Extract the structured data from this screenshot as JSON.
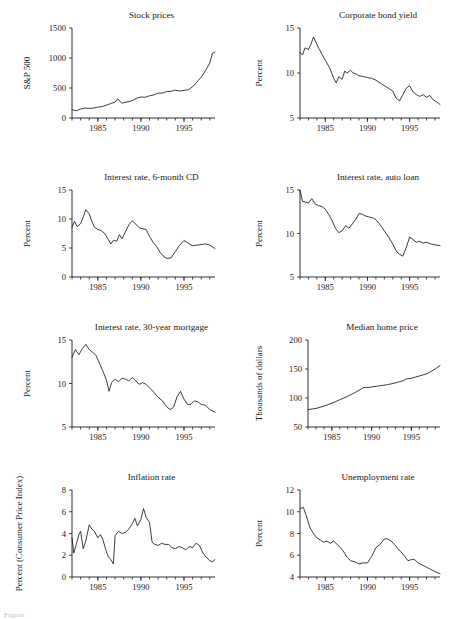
{
  "figure": {
    "background": "#ffffff",
    "ink_color": "#1a1a1a",
    "caption_fragment": "Figure"
  },
  "chart_data": [
    {
      "type": "line",
      "panel_index": 0,
      "title": "Stock prices",
      "xlabel": "",
      "ylabel": "S&P 500",
      "xlim": [
        1982.0,
        1998.6
      ],
      "ylim": [
        0,
        1500
      ],
      "yticks": [
        0,
        500,
        1000,
        1500
      ],
      "xticks": [
        1985,
        1990,
        1995
      ],
      "grid": false,
      "legend": "none",
      "x": [
        1982.0,
        1982.5,
        1983.0,
        1983.5,
        1984.0,
        1984.5,
        1985.0,
        1985.5,
        1986.0,
        1986.5,
        1987.0,
        1987.3,
        1987.8,
        1988.0,
        1988.5,
        1989.0,
        1989.5,
        1990.0,
        1990.5,
        1991.0,
        1991.5,
        1992.0,
        1992.5,
        1993.0,
        1993.5,
        1994.0,
        1994.5,
        1995.0,
        1995.5,
        1996.0,
        1996.5,
        1997.0,
        1997.5,
        1998.0,
        1998.3,
        1998.6
      ],
      "values": [
        140,
        120,
        150,
        165,
        160,
        165,
        180,
        190,
        215,
        240,
        265,
        320,
        245,
        255,
        270,
        290,
        330,
        350,
        345,
        370,
        385,
        415,
        415,
        440,
        445,
        465,
        450,
        460,
        470,
        520,
        600,
        680,
        790,
        920,
        1080,
        1100
      ]
    },
    {
      "type": "line",
      "panel_index": 1,
      "title": "Corporate bond yield",
      "xlabel": "",
      "ylabel": "Percent",
      "xlim": [
        1982.0,
        1998.6
      ],
      "ylim": [
        5,
        15
      ],
      "yticks": [
        5,
        10,
        15
      ],
      "xticks": [
        1985,
        1990,
        1995
      ],
      "grid": false,
      "legend": "none",
      "x": [
        1982.0,
        1982.3,
        1982.6,
        1983.0,
        1983.3,
        1983.6,
        1984.0,
        1984.3,
        1984.6,
        1985.0,
        1985.5,
        1986.0,
        1986.3,
        1986.6,
        1987.0,
        1987.3,
        1987.6,
        1988.0,
        1988.3,
        1988.6,
        1989.0,
        1989.5,
        1990.0,
        1990.5,
        1991.0,
        1991.5,
        1992.0,
        1992.5,
        1993.0,
        1993.4,
        1993.8,
        1994.2,
        1994.6,
        1995.0,
        1995.4,
        1995.8,
        1996.2,
        1996.6,
        1997.0,
        1997.4,
        1997.8,
        1998.2,
        1998.6
      ],
      "values": [
        12.3,
        12.0,
        12.8,
        12.6,
        13.2,
        14.0,
        13.2,
        12.6,
        12.1,
        11.4,
        10.6,
        9.4,
        8.9,
        9.6,
        9.3,
        10.2,
        10.0,
        10.3,
        10.0,
        9.9,
        9.7,
        9.6,
        9.5,
        9.4,
        9.2,
        8.9,
        8.6,
        8.3,
        8.0,
        7.2,
        6.9,
        7.6,
        8.3,
        8.6,
        7.9,
        7.6,
        7.4,
        7.6,
        7.3,
        7.5,
        7.0,
        6.8,
        6.5
      ]
    },
    {
      "type": "line",
      "panel_index": 2,
      "title": "Interest rate, 6-month CD",
      "xlabel": "",
      "ylabel": "Percent",
      "xlim": [
        1982.0,
        1998.6
      ],
      "ylim": [
        0,
        15
      ],
      "yticks": [
        0,
        5,
        10,
        15
      ],
      "xticks": [
        1985,
        1990,
        1995
      ],
      "grid": false,
      "legend": "none",
      "x": [
        1982.0,
        1982.3,
        1982.6,
        1983.0,
        1983.3,
        1983.6,
        1984.0,
        1984.3,
        1984.6,
        1985.0,
        1985.4,
        1985.8,
        1986.2,
        1986.5,
        1986.8,
        1987.2,
        1987.5,
        1987.8,
        1988.2,
        1988.6,
        1989.0,
        1989.4,
        1989.8,
        1990.2,
        1990.6,
        1991.0,
        1991.4,
        1991.8,
        1992.2,
        1992.6,
        1993.0,
        1993.5,
        1994.0,
        1994.5,
        1995.0,
        1995.5,
        1996.0,
        1996.5,
        1997.0,
        1997.5,
        1998.0,
        1998.6
      ],
      "values": [
        8.6,
        9.6,
        8.7,
        9.2,
        10.3,
        11.6,
        10.9,
        9.6,
        8.6,
        8.2,
        8.0,
        7.5,
        6.5,
        5.7,
        6.3,
        6.2,
        7.3,
        6.6,
        7.8,
        9.0,
        9.7,
        9.1,
        8.5,
        8.3,
        8.2,
        7.0,
        6.0,
        5.3,
        4.3,
        3.6,
        3.2,
        3.3,
        4.4,
        5.5,
        6.3,
        5.8,
        5.4,
        5.5,
        5.6,
        5.7,
        5.5,
        4.9
      ]
    },
    {
      "type": "line",
      "panel_index": 3,
      "title": "Interest rate, auto loan",
      "xlabel": "",
      "ylabel": "Percent",
      "xlim": [
        1982.0,
        1998.6
      ],
      "ylim": [
        5,
        15
      ],
      "yticks": [
        5,
        10,
        15
      ],
      "xticks": [
        1985,
        1990,
        1995
      ],
      "grid": false,
      "legend": "none",
      "x": [
        1982.0,
        1982.3,
        1982.7,
        1983.0,
        1983.4,
        1983.8,
        1984.2,
        1984.6,
        1985.0,
        1985.4,
        1985.8,
        1986.2,
        1986.6,
        1987.0,
        1987.4,
        1987.8,
        1988.2,
        1988.6,
        1989.0,
        1989.4,
        1989.8,
        1990.2,
        1990.6,
        1991.0,
        1991.5,
        1992.0,
        1992.5,
        1993.0,
        1993.4,
        1993.8,
        1994.2,
        1994.6,
        1995.0,
        1995.4,
        1995.8,
        1996.2,
        1996.6,
        1997.0,
        1997.5,
        1998.0,
        1998.6
      ],
      "values": [
        15.0,
        13.7,
        13.6,
        13.5,
        14.0,
        13.4,
        13.2,
        13.1,
        12.8,
        12.2,
        11.5,
        10.6,
        10.1,
        10.3,
        10.9,
        10.6,
        11.1,
        11.6,
        12.3,
        12.2,
        12.0,
        11.9,
        11.8,
        11.6,
        11.0,
        10.3,
        9.6,
        8.8,
        8.0,
        7.6,
        7.4,
        8.4,
        9.6,
        9.3,
        9.0,
        9.1,
        8.9,
        9.0,
        8.8,
        8.7,
        8.6
      ]
    },
    {
      "type": "line",
      "panel_index": 4,
      "title": "Interest rate, 30-year mortgage",
      "xlabel": "",
      "ylabel": "Percent",
      "xlim": [
        1982.0,
        1998.6
      ],
      "ylim": [
        5,
        15
      ],
      "yticks": [
        5,
        10,
        15
      ],
      "xticks": [
        1985,
        1990,
        1995
      ],
      "grid": false,
      "legend": "none",
      "x": [
        1982.0,
        1982.4,
        1982.8,
        1983.2,
        1983.6,
        1984.0,
        1984.4,
        1984.8,
        1985.2,
        1985.6,
        1986.0,
        1986.3,
        1986.6,
        1987.0,
        1987.4,
        1987.8,
        1988.2,
        1988.6,
        1989.0,
        1989.4,
        1989.8,
        1990.2,
        1990.6,
        1991.0,
        1991.5,
        1992.0,
        1992.5,
        1993.0,
        1993.4,
        1993.8,
        1994.2,
        1994.6,
        1995.0,
        1995.4,
        1995.8,
        1996.2,
        1996.6,
        1997.0,
        1997.5,
        1998.0,
        1998.6
      ],
      "values": [
        13.0,
        13.9,
        13.3,
        14.0,
        14.5,
        13.9,
        13.6,
        13.2,
        12.3,
        11.4,
        10.4,
        9.1,
        10.1,
        10.5,
        10.2,
        10.6,
        10.5,
        10.3,
        10.7,
        10.3,
        9.9,
        10.1,
        9.9,
        9.5,
        9.0,
        8.4,
        8.0,
        7.3,
        7.0,
        7.3,
        8.5,
        9.1,
        8.2,
        7.6,
        7.6,
        8.0,
        7.9,
        7.6,
        7.5,
        7.0,
        6.7
      ]
    },
    {
      "type": "line",
      "panel_index": 5,
      "title": "Median home price",
      "xlabel": "",
      "ylabel": "Thousands of dollars",
      "xlim": [
        1982.0,
        1998.6
      ],
      "ylim": [
        50,
        200
      ],
      "yticks": [
        50,
        100,
        150,
        200
      ],
      "xticks": [
        1985,
        1990,
        1995
      ],
      "grid": false,
      "legend": "none",
      "x": [
        1982.0,
        1983.0,
        1984.0,
        1985.0,
        1986.0,
        1987.0,
        1988.0,
        1989.0,
        1989.4,
        1990.0,
        1991.0,
        1992.0,
        1993.0,
        1994.0,
        1994.4,
        1995.0,
        1996.0,
        1997.0,
        1998.0,
        1998.6
      ],
      "values": [
        80,
        82,
        86,
        91,
        97,
        103,
        110,
        118,
        118,
        119,
        121,
        123,
        126,
        130,
        133,
        134,
        138,
        142,
        150,
        156
      ]
    },
    {
      "type": "line",
      "panel_index": 6,
      "title": "Inflation rate",
      "xlabel": "",
      "ylabel": "Percent (Consumer Price Index)",
      "xlim": [
        1982.0,
        1998.6
      ],
      "ylim": [
        0,
        8
      ],
      "yticks": [
        0,
        2,
        4,
        6,
        8
      ],
      "xticks": [
        1985,
        1990,
        1995
      ],
      "grid": false,
      "legend": "none",
      "x": [
        1982.0,
        1982.2,
        1982.5,
        1982.8,
        1983.0,
        1983.3,
        1983.6,
        1984.0,
        1984.3,
        1984.6,
        1985.0,
        1985.3,
        1985.6,
        1986.0,
        1986.2,
        1986.5,
        1986.8,
        1987.0,
        1987.4,
        1987.8,
        1988.2,
        1988.6,
        1989.0,
        1989.3,
        1989.6,
        1990.0,
        1990.3,
        1990.6,
        1991.0,
        1991.3,
        1991.6,
        1992.0,
        1992.4,
        1992.8,
        1993.2,
        1993.6,
        1994.0,
        1994.4,
        1994.8,
        1995.2,
        1995.6,
        1996.0,
        1996.4,
        1996.8,
        1997.2,
        1997.6,
        1998.0,
        1998.3,
        1998.6
      ],
      "values": [
        3.6,
        2.2,
        3.0,
        3.9,
        4.2,
        2.6,
        3.3,
        4.8,
        4.4,
        4.2,
        3.6,
        3.9,
        3.4,
        2.3,
        1.9,
        1.6,
        1.2,
        3.8,
        4.2,
        4.0,
        4.1,
        4.4,
        4.9,
        5.4,
        4.7,
        5.3,
        6.3,
        5.5,
        5.0,
        3.2,
        3.0,
        2.9,
        3.1,
        3.0,
        3.0,
        2.7,
        2.6,
        2.8,
        2.7,
        2.5,
        2.8,
        2.7,
        3.1,
        2.9,
        2.2,
        1.8,
        1.5,
        1.4,
        1.6
      ]
    },
    {
      "type": "line",
      "panel_index": 7,
      "title": "Unemployment rate",
      "xlabel": "",
      "ylabel": "Percent",
      "xlim": [
        1982.0,
        1998.6
      ],
      "ylim": [
        4,
        12
      ],
      "yticks": [
        4,
        6,
        8,
        10,
        12
      ],
      "xticks": [
        1985,
        1990,
        1995
      ],
      "grid": false,
      "legend": "none",
      "x": [
        1982.0,
        1982.4,
        1982.8,
        1983.2,
        1983.6,
        1984.0,
        1984.4,
        1984.8,
        1985.2,
        1985.6,
        1986.0,
        1986.4,
        1986.8,
        1987.2,
        1987.6,
        1988.0,
        1988.5,
        1989.0,
        1989.5,
        1990.0,
        1990.5,
        1991.0,
        1991.5,
        1992.0,
        1992.4,
        1992.8,
        1993.2,
        1993.6,
        1994.0,
        1994.4,
        1994.8,
        1995.2,
        1995.6,
        1996.0,
        1996.5,
        1997.0,
        1997.5,
        1998.0,
        1998.6
      ],
      "values": [
        10.3,
        10.4,
        9.5,
        8.5,
        8.0,
        7.6,
        7.4,
        7.2,
        7.3,
        7.1,
        7.3,
        7.0,
        6.7,
        6.3,
        5.8,
        5.5,
        5.4,
        5.2,
        5.3,
        5.3,
        5.9,
        6.7,
        7.0,
        7.5,
        7.5,
        7.3,
        7.0,
        6.6,
        6.3,
        5.9,
        5.5,
        5.6,
        5.6,
        5.3,
        5.1,
        4.9,
        4.7,
        4.5,
        4.3
      ]
    }
  ]
}
